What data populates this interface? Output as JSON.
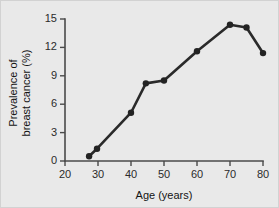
{
  "chart_data": {
    "type": "line",
    "title": "",
    "xlabel": "Age (years)",
    "ylabel_line1": "Prevalence of",
    "ylabel_line2": "breast cancer (%)",
    "ylabel": "Prevalence of breast cancer (%)",
    "xlim": [
      20,
      80
    ],
    "ylim": [
      0,
      15
    ],
    "xticks": [
      20,
      30,
      40,
      50,
      60,
      70,
      80
    ],
    "xtick_labels": [
      "20",
      "30",
      "40",
      "50",
      "60",
      "70",
      "80"
    ],
    "yticks": [
      0,
      3,
      6,
      9,
      12,
      15
    ],
    "ytick_labels": [
      "0",
      "3",
      "6",
      "9",
      "12",
      "15"
    ],
    "grid": false,
    "legend": false,
    "marker": "filled-circle",
    "line_color": "#2a2a2a",
    "marker_color": "#232323",
    "background_color": "#e9e9e9",
    "series": [
      {
        "name": "Prevalence of breast cancer",
        "x": [
          27.3,
          29.7,
          40.0,
          44.5,
          50.0,
          60.0,
          70.0,
          75.0,
          80.0
        ],
        "values": [
          0.5,
          1.3,
          5.1,
          8.2,
          8.5,
          11.6,
          14.4,
          14.1,
          11.4
        ]
      }
    ]
  }
}
